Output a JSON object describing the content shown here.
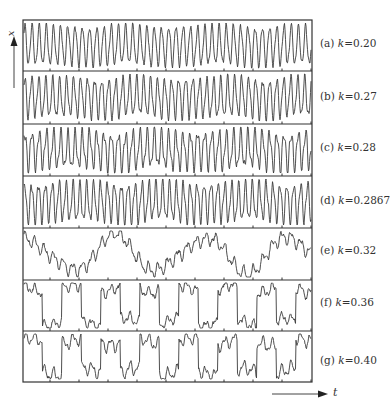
{
  "chart_data": {
    "type": "line",
    "title": "",
    "xlabel": "t",
    "ylabel": "x",
    "grid": false,
    "legend": "none",
    "layout": "7 vertically stacked time-series panels sharing time axis",
    "x_ticks": "unlabeled ticks every ~29px",
    "panels": [
      {
        "id": "a",
        "label": "(a)",
        "k": "0.20",
        "behavior": "fast regular oscillation",
        "period_px": 7.2,
        "amp": 0.42,
        "slow_amp": 0.05,
        "fast_amp": 0.08,
        "seed": 1
      },
      {
        "id": "b",
        "label": "(b)",
        "k": "0.27",
        "behavior": "fast oscillation with modulated peaks",
        "period_px": 7.0,
        "amp": 0.4,
        "slow_amp": 0.08,
        "fast_amp": 0.1,
        "seed": 2
      },
      {
        "id": "c",
        "label": "(c)",
        "k": "0.28",
        "behavior": "period-doubled-like alternating peaks",
        "period_px": 7.2,
        "amp": 0.38,
        "slow_amp": 0.08,
        "fast_amp": 0.14,
        "seed": 3
      },
      {
        "id": "d",
        "label": "(d)",
        "k": "0.2867",
        "behavior": "fast oscillation, irregular",
        "period_px": 6.9,
        "amp": 0.4,
        "slow_amp": 0.07,
        "fast_amp": 0.12,
        "seed": 4
      },
      {
        "id": "e",
        "label": "(e)",
        "k": "0.32",
        "behavior": "irregular switching between high and low states",
        "period_px": 9.5,
        "amp": 0.12,
        "slow_amp": 0.33,
        "fast_amp": 0.06,
        "seed": 5,
        "slow_period_px": 88
      },
      {
        "id": "f",
        "label": "(f)",
        "k": "0.36",
        "behavior": "square-wave-like switching",
        "period_px": 9.5,
        "amp": 0.1,
        "slow_amp": 0.36,
        "fast_amp": 0.05,
        "seed": 6,
        "slow_period_px": 39
      },
      {
        "id": "g",
        "label": "(g)",
        "k": "0.40",
        "behavior": "switching with intermittent bursts",
        "period_px": 9.5,
        "amp": 0.12,
        "slow_amp": 0.33,
        "fast_amp": 0.06,
        "seed": 7,
        "slow_period_px": 39
      }
    ]
  },
  "labels": {
    "y_axis": "x",
    "x_axis": "t",
    "panels": [
      {
        "prefix": "(a) ",
        "k_sym": "k",
        "value": "=0.20"
      },
      {
        "prefix": "(b) ",
        "k_sym": "k",
        "value": "=0.27"
      },
      {
        "prefix": "(c) ",
        "k_sym": "k",
        "value": "=0.28"
      },
      {
        "prefix": "(d) ",
        "k_sym": "k",
        "value": "=0.2867"
      },
      {
        "prefix": "(e) ",
        "k_sym": "k",
        "value": "=0.32"
      },
      {
        "prefix": "(f) ",
        "k_sym": "k",
        "value": "=0.36"
      },
      {
        "prefix": "(g) ",
        "k_sym": "k",
        "value": "=0.40"
      }
    ]
  },
  "colors": {
    "line": "#3a3a3a",
    "frame": "#333333",
    "background": "#ffffff"
  }
}
